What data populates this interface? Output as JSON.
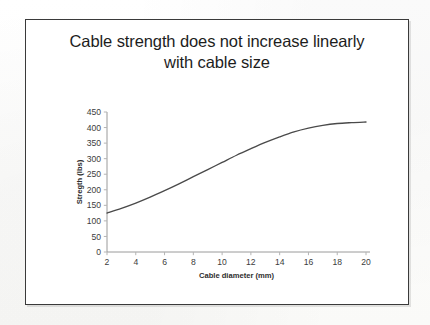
{
  "slide": {
    "title_line1": "Cable strength does not increase linearly",
    "title_line2": "with cable size",
    "background_color": "#ffffff",
    "frame_color": "#3a3a3a"
  },
  "chart_data": {
    "type": "line",
    "title": "Cable strength does not increase linearly with cable size",
    "xlabel": "Cable diameter (mm)",
    "ylabel": "Stregth (lbs)",
    "xlim": [
      2,
      20
    ],
    "ylim": [
      0,
      450
    ],
    "grid": false,
    "legend": null,
    "legend_position": "none",
    "line_color": "#4a4a4a",
    "x_tick_labels": [
      "2",
      "4",
      "6",
      "8",
      "10",
      "12",
      "14",
      "16",
      "18",
      "20"
    ],
    "x_ticks": [
      2,
      4,
      6,
      8,
      10,
      12,
      14,
      16,
      18,
      20
    ],
    "y_tick_labels": [
      "0",
      "50",
      "100",
      "150",
      "200",
      "250",
      "300",
      "350",
      "400",
      "450"
    ],
    "y_ticks": [
      0,
      50,
      100,
      150,
      200,
      250,
      300,
      350,
      400,
      450
    ],
    "x": [
      2,
      3,
      4,
      5,
      6,
      7,
      8,
      9,
      10,
      11,
      12,
      13,
      14,
      15,
      16,
      17,
      18,
      19,
      20
    ],
    "values": [
      125,
      140,
      157,
      176,
      197,
      219,
      242,
      265,
      288,
      311,
      332,
      352,
      370,
      386,
      398,
      407,
      413,
      416,
      418
    ],
    "series": [
      {
        "name": "Cable strength",
        "values": [
          125,
          140,
          157,
          176,
          197,
          219,
          242,
          265,
          288,
          311,
          332,
          352,
          370,
          386,
          398,
          407,
          413,
          416,
          418
        ]
      }
    ]
  },
  "axes_geometry": {
    "left_px": 107,
    "right_px": 366,
    "top_px": 112,
    "bottom_px": 252
  }
}
